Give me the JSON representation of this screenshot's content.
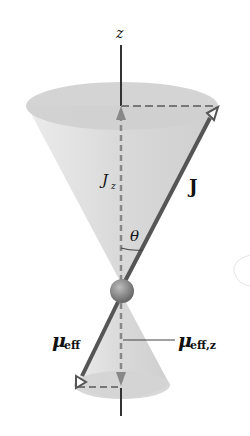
{
  "diagram": {
    "labels": {
      "z_axis": "z",
      "j_z": "J",
      "j_z_sub": "z",
      "j_vector": "J",
      "theta": "θ",
      "mu_eff": "μ",
      "mu_eff_sub": "eff",
      "mu_eff_z": "μ",
      "mu_eff_z_sub": "eff,z"
    },
    "colors": {
      "cone_fill": "#d9d9d9",
      "cone_top": "#cfcfcf",
      "vector": "#555555",
      "axis": "#333333",
      "dashed": "#777777",
      "sphere": "#8a8a8a"
    }
  }
}
